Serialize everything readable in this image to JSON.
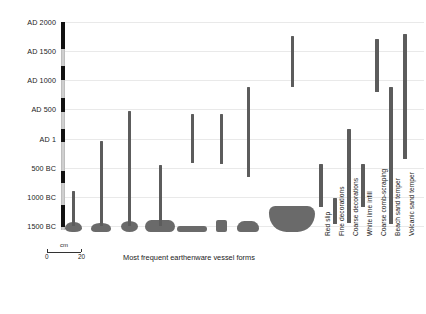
{
  "chart_data": {
    "type": "bar",
    "orientation": "vertical-range",
    "title": "",
    "xlabel": "",
    "ylabel": "",
    "ylim": [
      -1500,
      2000
    ],
    "grid": true,
    "legend": "none",
    "y_axis": {
      "ticks": [
        {
          "label": "AD 2000",
          "value": 2000
        },
        {
          "label": "AD 1500",
          "value": 1500
        },
        {
          "label": "AD 1000",
          "value": 1000
        },
        {
          "label": "AD 500",
          "value": 500
        },
        {
          "label": "AD 1",
          "value": 1
        },
        {
          "label": "500 BC",
          "value": -500
        },
        {
          "label": "1000 BC",
          "value": -1000
        },
        {
          "label": "1500 BC",
          "value": -1500
        }
      ]
    },
    "groups": [
      {
        "name": "Most frequent earthenware vessel forms",
        "caption": "Most frequent earthenware vessel forms",
        "series": [
          {
            "name": "Vessel form 1",
            "start": -1500,
            "end": -900,
            "shape": "round-base-jar"
          },
          {
            "name": "Vessel form 2",
            "start": -1500,
            "end": -50,
            "shape": "flat-base-jar"
          },
          {
            "name": "Vessel form 3",
            "start": -1500,
            "end": 480,
            "shape": "round-bowl-jar"
          },
          {
            "name": "Vessel form 4",
            "start": -1500,
            "end": -450,
            "shape": "rounded-rect-bowl"
          },
          {
            "name": "Vessel form 5",
            "start": -420,
            "end": 430,
            "shape": "flat-dish"
          },
          {
            "name": "Vessel form 6",
            "start": -430,
            "end": 420,
            "shape": "small-cube-cup"
          },
          {
            "name": "Vessel form 7",
            "start": -660,
            "end": 880,
            "shape": "trapezoid-bowl"
          },
          {
            "name": "Vessel form 8",
            "start": 880,
            "end": 1760,
            "shape": "hemispherical-bowl"
          }
        ]
      },
      {
        "name": "Surface treatments and tempers",
        "caption": "",
        "series": [
          {
            "name": "Red slip",
            "start": -1180,
            "end": -440
          },
          {
            "name": "Fine decorations",
            "start": -1460,
            "end": -1020
          },
          {
            "name": "Coarse decorations",
            "start": -1450,
            "end": 170
          },
          {
            "name": "White lime infill",
            "start": -1180,
            "end": -440
          },
          {
            "name": "Coarse comb-scraping",
            "start": 800,
            "end": 1700
          },
          {
            "name": "Beach sand temper",
            "start": -1460,
            "end": 890
          },
          {
            "name": "Volcanic sand temper",
            "start": -350,
            "end": 1790
          }
        ]
      }
    ],
    "scale_bar": {
      "unit": "cm",
      "min_label": "0",
      "max_label": "20"
    },
    "colors": {
      "bar": "#5c5c5c",
      "vessel": "#6a6a6a",
      "grid": "#e9e9e9",
      "axis_dark": "#111111",
      "axis_light": "#cfcfcf",
      "text": "#1a1a1a",
      "background": "#ffffff"
    }
  }
}
